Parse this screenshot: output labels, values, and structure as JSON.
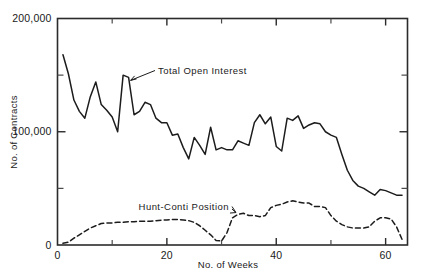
{
  "chart_data": {
    "type": "line",
    "title": "",
    "subtitle": "",
    "xlabel": "No. of Weeks",
    "ylabel": "No. of Contracts",
    "xlim": [
      0,
      64
    ],
    "ylim": [
      0,
      200000
    ],
    "grid": false,
    "legend_position": "inline-annotations",
    "x_ticks_major": [
      0,
      20,
      40,
      60
    ],
    "x_tick_labels": [
      "0",
      "20",
      "40",
      "60"
    ],
    "x_ticks_minor": [
      10,
      30,
      50
    ],
    "y_ticks_major": [
      0,
      100000,
      200000
    ],
    "y_tick_labels": [
      "0",
      "100,000",
      "200,000"
    ],
    "y_ticks_minor": [
      50000,
      150000
    ],
    "annotations": [
      {
        "id": "total-open-interest",
        "text": "Total Open Interest",
        "points_to_week": 13,
        "points_to_value": 148000
      },
      {
        "id": "hunt-conti-position",
        "text": "Hunt-Conti Position",
        "points_to_week": 33,
        "points_to_value": 26000
      }
    ],
    "series": [
      {
        "name": "Total Open Interest",
        "style": "solid",
        "x": [
          1,
          2,
          3,
          4,
          5,
          6,
          7,
          8,
          9,
          10,
          11,
          12,
          13,
          14,
          15,
          16,
          17,
          18,
          19,
          20,
          21,
          22,
          23,
          24,
          25,
          26,
          27,
          28,
          29,
          30,
          31,
          32,
          33,
          34,
          35,
          36,
          37,
          38,
          39,
          40,
          41,
          42,
          43,
          44,
          45,
          46,
          47,
          48,
          49,
          50,
          51,
          52,
          53,
          54,
          55,
          56,
          57,
          58,
          59,
          60,
          61,
          62,
          63
        ],
        "values": [
          168000,
          151000,
          128000,
          118000,
          112000,
          131000,
          144000,
          124000,
          119000,
          113000,
          100000,
          150000,
          148000,
          115000,
          118000,
          126000,
          124000,
          112000,
          108000,
          108000,
          97000,
          98000,
          86000,
          76000,
          95000,
          88000,
          80000,
          104000,
          84000,
          86000,
          84000,
          84000,
          92000,
          90000,
          88000,
          108000,
          115000,
          107000,
          113000,
          87000,
          83000,
          112000,
          110000,
          114000,
          103000,
          106000,
          108000,
          107000,
          100000,
          97000,
          95000,
          80000,
          66000,
          57000,
          52000,
          50000,
          47000,
          44000,
          49000,
          48000,
          46000,
          44000,
          44000
        ]
      },
      {
        "name": "Hunt-Conti Position",
        "style": "dashed",
        "x": [
          1,
          2,
          3,
          4,
          5,
          6,
          7,
          8,
          9,
          10,
          11,
          12,
          13,
          14,
          15,
          16,
          17,
          18,
          19,
          20,
          21,
          22,
          23,
          24,
          25,
          26,
          27,
          28,
          29,
          30,
          31,
          32,
          33,
          34,
          35,
          36,
          37,
          38,
          39,
          40,
          41,
          42,
          43,
          44,
          45,
          46,
          47,
          48,
          49,
          50,
          51,
          52,
          53,
          54,
          55,
          56,
          57,
          58,
          59,
          60,
          61,
          62,
          63
        ],
        "values": [
          1500,
          2500,
          6000,
          9000,
          12000,
          15000,
          17000,
          19000,
          19500,
          19500,
          20000,
          20000,
          20500,
          20500,
          21000,
          21000,
          21000,
          21500,
          22000,
          22000,
          22500,
          22500,
          22000,
          21500,
          20000,
          17000,
          13000,
          9000,
          4000,
          3500,
          11000,
          24000,
          27000,
          28000,
          26000,
          26000,
          25000,
          26000,
          33000,
          35000,
          36000,
          38000,
          39000,
          38000,
          37000,
          37000,
          34000,
          34000,
          33000,
          26000,
          21000,
          18000,
          16000,
          15000,
          15000,
          15000,
          16000,
          21000,
          24000,
          24000,
          23000,
          16000,
          5000
        ]
      }
    ]
  }
}
